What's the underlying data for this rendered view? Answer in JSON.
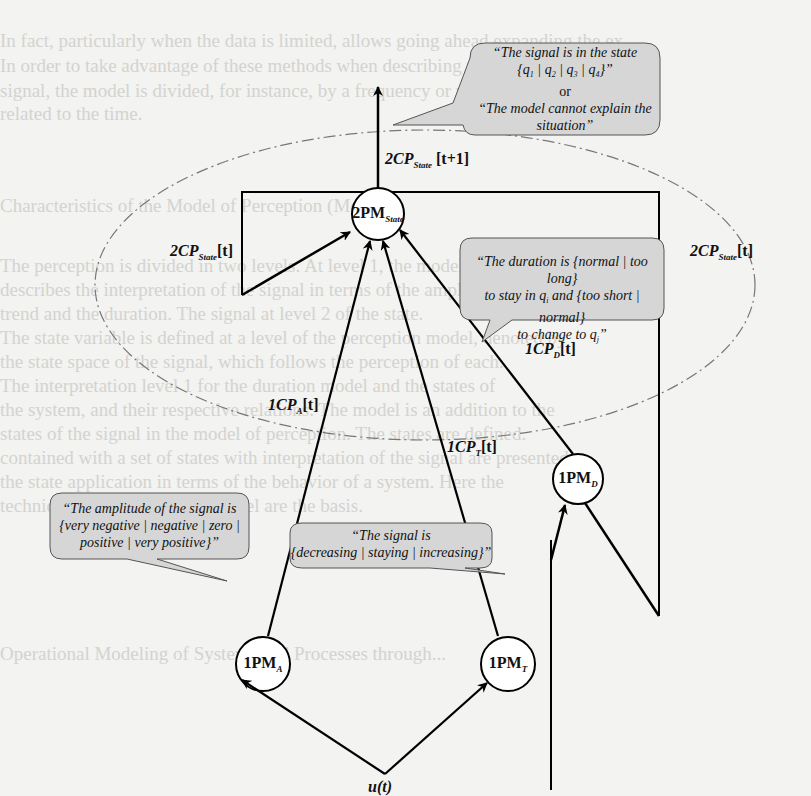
{
  "diagram": {
    "callouts": {
      "state": {
        "line1": "“The signal is in the state",
        "line2": "{q1 | q2 | q3 | q4}”",
        "line3": "or",
        "line4": "“The model cannot explain the",
        "line5": "situation”"
      },
      "duration": {
        "line1": "“The duration is {normal | too long}",
        "line2": "to stay in qi and {too short | normal}",
        "line3": "to change to qj”"
      },
      "amplitude": {
        "line1": "“The amplitude of the signal is",
        "line2": "{very negative | negative | zero |",
        "line3": "positive | very positive}”"
      },
      "trend": {
        "line1": "“The signal is",
        "line2": "{decreasing | staying | increasing}”"
      }
    },
    "nodes": {
      "state": {
        "main": "2PM",
        "sub": "State"
      },
      "amplitude": {
        "main": "1PM",
        "sub": "A"
      },
      "trend": {
        "main": "1PM",
        "sub": "T"
      },
      "duration": {
        "main": "1PM",
        "sub": "D"
      }
    },
    "edge_labels": {
      "output": {
        "main": "2CP",
        "sub": "State",
        "suffix": "[t+1]"
      },
      "feedback_left": {
        "main": "2CP",
        "sub": "State",
        "suffix": "[t]"
      },
      "feedback_right": {
        "main": "2CP",
        "sub": "State",
        "suffix": "[t]"
      },
      "cp_a": {
        "main": "1CP",
        "sub": "A",
        "suffix": "[t]"
      },
      "cp_t": {
        "main": "1CP",
        "sub": "T",
        "suffix": "[t]"
      },
      "cp_d": {
        "main": "1CP",
        "sub": "D",
        "suffix": "[t]"
      }
    },
    "inputs": {
      "signal": "u(t)",
      "time": "t"
    }
  },
  "background_text": [
    "n fact, particularly                              ...llows going ahead expanding this ...",
    "n order to                                        ...nch describing the ...ability of the ...",
    "                                                   ...or...  ...value  s(t)  (t) ...",
    "",
    "",
    "Characte...  the Model of Perception  ...",
    "",
    "Perception                                        ...pretation of the signal ...",
    "states ...",
    "ment ...",
    "...",
    "...",
    "...",
    "...",
    "...",
    "...",
    "...",
    "...",
    "",
    "",
    "",
    "Operational Modeling of Systems and Processes ..."
  ],
  "colors": {
    "callout_fill": "#d6d6d6",
    "callout_stroke": "#555555",
    "line": "#000000",
    "ellipse": "#666666"
  }
}
